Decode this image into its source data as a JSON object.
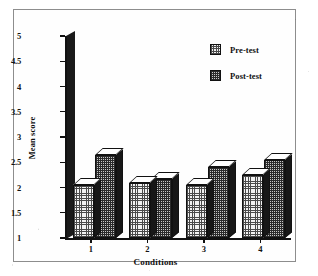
{
  "chart_data": {
    "type": "bar",
    "title": "",
    "xlabel": "Conditions",
    "ylabel": "Mean score",
    "categories": [
      "1",
      "2",
      "3",
      "4"
    ],
    "series": [
      {
        "name": "Pre-test",
        "values": [
          2.05,
          2.08,
          2.05,
          2.25
        ]
      },
      {
        "name": "Post-test",
        "values": [
          2.65,
          2.17,
          2.4,
          2.55
        ]
      }
    ],
    "ylim": [
      1,
      5
    ],
    "yticks": [
      "1",
      "1.5",
      "2",
      "2.5",
      "3",
      "3.5",
      "4",
      "4.5",
      "5"
    ],
    "ytick_values": [
      1,
      1.5,
      2,
      2.5,
      3,
      3.5,
      4,
      4.5,
      5
    ],
    "xticks": [
      "1",
      "2",
      "3",
      "4"
    ],
    "grid": false,
    "legend_position": "top-right",
    "style": "3d-bar",
    "colors": {
      "pre_test_fill": "#f2f2f2",
      "post_test_fill": "#c9c9c9",
      "outline": "#111111",
      "axis": "#111111",
      "frame_border": "#8d8d8d",
      "background": "#ffffff"
    }
  },
  "legend": {
    "items": [
      {
        "label": "Pre-test",
        "swatch": "pre-test-pattern"
      },
      {
        "label": "Post-test",
        "swatch": "post-test-pattern"
      }
    ]
  }
}
